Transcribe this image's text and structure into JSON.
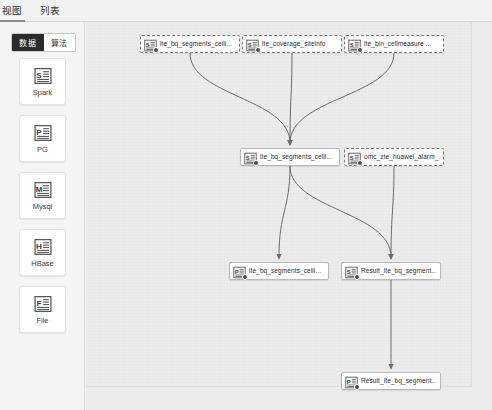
{
  "window": {
    "title": "Data Pipeline Designer"
  },
  "tabs": [
    {
      "id": "view",
      "label": "视图",
      "active": true
    },
    {
      "id": "list",
      "label": "列表",
      "active": false
    }
  ],
  "sidebar": {
    "segmented": [
      {
        "id": "data",
        "label": "数据",
        "active": true
      },
      {
        "id": "algorithm",
        "label": "算法",
        "active": false
      }
    ],
    "items": [
      {
        "id": "spark",
        "label": "Spark",
        "icon": "spark-doc-icon",
        "glyph": "S"
      },
      {
        "id": "pg",
        "label": "PG",
        "icon": "pg-doc-icon",
        "glyph": "P"
      },
      {
        "id": "mysql",
        "label": "Mysql",
        "icon": "mysql-doc-icon",
        "glyph": "M"
      },
      {
        "id": "hbase",
        "label": "HBase",
        "icon": "hbase-doc-icon",
        "glyph": "H"
      },
      {
        "id": "file",
        "label": "File",
        "icon": "file-doc-icon",
        "glyph": "F"
      }
    ]
  },
  "canvas": {
    "nodes": [
      {
        "id": "n1",
        "label": "lte_bq_segments_celli...",
        "glyph": "S",
        "type": "spark",
        "selected": true,
        "x": 140,
        "y": 35,
        "w": 100
      },
      {
        "id": "n2",
        "label": "lte_coverage_siteinfo",
        "glyph": "S",
        "type": "spark",
        "selected": true,
        "x": 242,
        "y": 35,
        "w": 100
      },
      {
        "id": "n3",
        "label": "lte_bin_cellmeasure ...",
        "glyph": "S",
        "type": "spark",
        "selected": true,
        "x": 344,
        "y": 35,
        "w": 100
      },
      {
        "id": "n4",
        "label": "lte_bq_segments_celli...",
        "glyph": "S",
        "type": "spark",
        "selected": false,
        "x": 240,
        "y": 148,
        "w": 100
      },
      {
        "id": "n5",
        "label": "omc_zte_huawei_alarm_...",
        "glyph": "S",
        "type": "spark",
        "selected": true,
        "x": 344,
        "y": 148,
        "w": 100
      },
      {
        "id": "n6",
        "label": "lte_bq_segments_celli...",
        "glyph": "P",
        "type": "pg",
        "selected": false,
        "x": 229,
        "y": 262,
        "w": 100
      },
      {
        "id": "n7",
        "label": "Result_lte_bq_segment...",
        "glyph": "S",
        "type": "spark",
        "selected": false,
        "x": 341,
        "y": 262,
        "w": 100
      },
      {
        "id": "n8",
        "label": "Result_lte_bq_segment...",
        "glyph": "P",
        "type": "pg",
        "selected": false,
        "x": 341,
        "y": 372,
        "w": 100
      }
    ],
    "edges": [
      {
        "from": "n1",
        "to": "n4"
      },
      {
        "from": "n2",
        "to": "n4"
      },
      {
        "from": "n3",
        "to": "n4"
      },
      {
        "from": "n4",
        "to": "n6"
      },
      {
        "from": "n4",
        "to": "n7"
      },
      {
        "from": "n5",
        "to": "n7"
      },
      {
        "from": "n7",
        "to": "n8"
      }
    ]
  },
  "colors": {
    "edge": "#6b6b6b",
    "node_border": "#b8b8b8",
    "selected_border": "#7a7a7a",
    "canvas_bg": "#ececec",
    "sidebar_bg": "#f4f4f4",
    "segment_active_bg": "#2b2b2b",
    "badge": "#4a4a4a"
  }
}
